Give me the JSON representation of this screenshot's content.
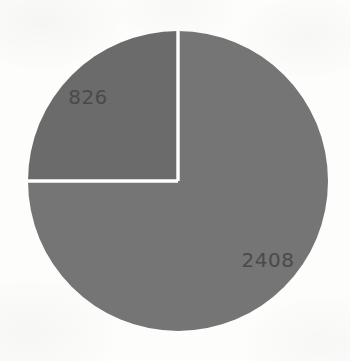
{
  "chart_data": {
    "type": "pie",
    "title": "",
    "subtitle": "",
    "xlabel": "",
    "ylabel": "",
    "legend": "none",
    "grid": false,
    "labels_shown": "value",
    "total": 3234,
    "background_color": "#fdfdfc",
    "divider_color": "#ffffff",
    "divider_width_px": 3,
    "label_color": "#4a4a4a",
    "center": {
      "x": 178,
      "y": 181
    },
    "radius": 150,
    "start_angle_deg": -90,
    "direction": "counterclockwise",
    "slices": [
      {
        "name": "slice-826",
        "value": 826,
        "label": "826",
        "color": "#6b6b6b",
        "angle_deg": 90,
        "percent": 25.5,
        "start_angle_deg": -90,
        "end_angle_deg": 180,
        "label_x": 88,
        "label_y": 98
      },
      {
        "name": "slice-2408",
        "value": 2408,
        "label": "2408",
        "color": "#757575",
        "angle_deg": 270,
        "percent": 74.5,
        "start_angle_deg": -90,
        "end_angle_deg": 180,
        "label_x": 268,
        "label_y": 261
      }
    ]
  }
}
